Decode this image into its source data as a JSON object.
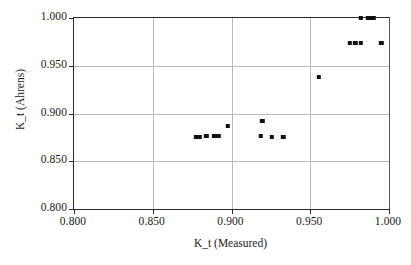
{
  "chart_data": {
    "type": "scatter",
    "title": "",
    "xlabel": "K_t (Measured)",
    "ylabel": "K_t (Ahrens)",
    "xlim": [
      0.8,
      1.0
    ],
    "ylim": [
      0.8,
      1.0
    ],
    "xticks": [
      "0.800",
      "0.850",
      "0.900",
      "0.950",
      "1.000"
    ],
    "yticks": [
      "0.800",
      "0.850",
      "0.900",
      "0.950",
      "1.000"
    ],
    "xtick_values": [
      0.8,
      0.85,
      0.9,
      0.95,
      1.0
    ],
    "ytick_values": [
      0.8,
      0.85,
      0.9,
      0.95,
      1.0
    ],
    "grid": true,
    "legend": false,
    "marker": "filled-square",
    "marker_color": "#111111",
    "series": [
      {
        "name": "K_t comparison",
        "points": [
          [
            0.8775,
            0.8755
          ],
          [
            0.8795,
            0.8755
          ],
          [
            0.884,
            0.8765
          ],
          [
            0.889,
            0.876
          ],
          [
            0.8905,
            0.8765
          ],
          [
            0.892,
            0.8765
          ],
          [
            0.8975,
            0.8865
          ],
          [
            0.9195,
            0.892
          ],
          [
            0.9185,
            0.876
          ],
          [
            0.9255,
            0.8755
          ],
          [
            0.933,
            0.875
          ],
          [
            0.9555,
            0.938
          ],
          [
            0.975,
            0.974
          ],
          [
            0.9785,
            0.974
          ],
          [
            0.982,
            0.974
          ],
          [
            0.995,
            0.974
          ],
          [
            0.982,
            0.9995
          ],
          [
            0.9865,
            0.9995
          ],
          [
            0.9885,
            0.9995
          ],
          [
            0.99,
            0.9995
          ]
        ]
      }
    ]
  }
}
